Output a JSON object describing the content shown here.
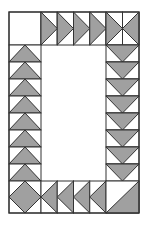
{
  "colors": {
    "background": "#ffffff",
    "fill": "#a0a0a0",
    "stroke": "#333333"
  },
  "frame": {
    "x": 9,
    "y": 12,
    "width": 130,
    "height": 201
  },
  "blocks": {
    "top_left": {
      "type": "plain-square",
      "x": 9,
      "y": 12,
      "w": 32,
      "h": 33
    },
    "top_row": {
      "type": "flying-geese",
      "direction": "right",
      "count": 4,
      "x": 41,
      "y": 12,
      "cell_w": 16.25,
      "h": 33
    },
    "top_right": [
      {
        "type": "flying-goose",
        "direction": "right",
        "x": 106,
        "y": 12,
        "w": 16.5,
        "h": 33
      },
      {
        "type": "flying-goose",
        "direction": "left",
        "x": 122.5,
        "y": 12,
        "w": 16.5,
        "h": 33
      }
    ],
    "left_column": {
      "type": "flying-geese",
      "direction": "up",
      "count": 8,
      "x": 9,
      "y": 45,
      "w": 32,
      "cell_h": 17
    },
    "right_column": {
      "type": "flying-geese",
      "direction": "down",
      "count": 8,
      "x": 106,
      "y": 45,
      "w": 33,
      "cell_h": 17
    },
    "bottom_left": {
      "type": "square-in-square",
      "x": 9,
      "y": 181,
      "w": 32,
      "h": 32
    },
    "bottom_row": {
      "type": "flying-geese",
      "direction": "left",
      "count": 4,
      "x": 41,
      "y": 181,
      "cell_w": 16.25,
      "h": 32
    },
    "bottom_right": {
      "type": "half-square-triangle",
      "filled": "bottom-right",
      "x": 106,
      "y": 181,
      "w": 33,
      "h": 32
    }
  }
}
